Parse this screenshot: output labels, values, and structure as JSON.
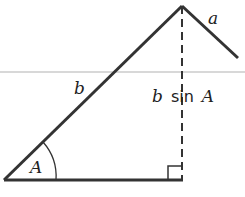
{
  "diagram": {
    "labels": {
      "side_a": "a",
      "side_b": "b",
      "height_var": "b",
      "height_fn": "sin",
      "height_angle": "A",
      "angle": "A"
    },
    "colors": {
      "stroke": "#333333",
      "scan_line": "#d8d8d8",
      "background": "#ffffff"
    }
  }
}
